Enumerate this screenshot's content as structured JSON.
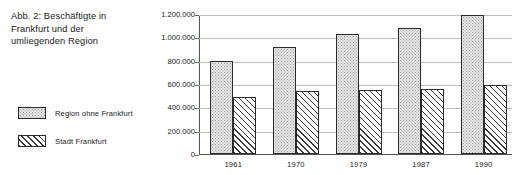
{
  "figure": {
    "caption_lines": [
      "Abb. 2: Beschäftigte in",
      "Frankfurt und der",
      "umliegenden Region"
    ],
    "caption_full": "Abb. 2: Beschäftigte in Frankfurt und der umliegenden Region"
  },
  "legend": {
    "position": "left",
    "items": [
      {
        "label": "Region ohne Frankfurt",
        "pattern": "dots",
        "color": "#e8e8e8"
      },
      {
        "label": "Stadt Frankfurt",
        "pattern": "diagonal-hatch",
        "color": "#ffffff"
      }
    ]
  },
  "chart_data": {
    "type": "bar",
    "title": "Abb. 2: Beschäftigte in Frankfurt und der umliegenden Region",
    "xlabel": "",
    "ylabel": "",
    "categories": [
      "1961",
      "1970",
      "1979",
      "1987",
      "1990"
    ],
    "series": [
      {
        "name": "Region ohne Frankfurt",
        "values": [
          800000,
          920000,
          1030000,
          1080000,
          1195000
        ]
      },
      {
        "name": "Stadt Frankfurt",
        "values": [
          490000,
          540000,
          545000,
          560000,
          595000
        ]
      }
    ],
    "ylim": [
      0,
      1200000
    ],
    "ytick_values": [
      0,
      200000,
      400000,
      600000,
      800000,
      1000000,
      1200000
    ],
    "ytick_labels": [
      "0",
      "200.000",
      "400.000",
      "600.000",
      "800.000",
      "1.000.000",
      "1.200.000"
    ],
    "grid": true,
    "grid_axis": "y",
    "legend_position": "left-outside",
    "number_format": "de-DE"
  }
}
